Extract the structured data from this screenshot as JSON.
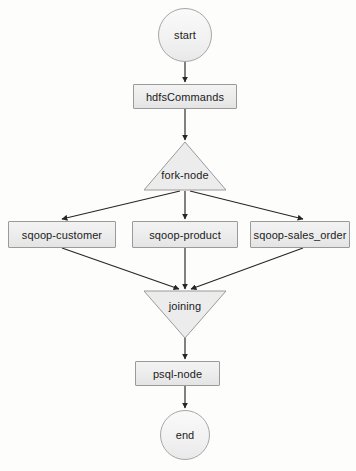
{
  "diagram": {
    "background_color": "#fdfdfc",
    "node_fill": "#ececec",
    "node_border": "#9a9a9a",
    "edge_color": "#262626",
    "text_color": "#1b1b1b"
  },
  "nodes": {
    "start": {
      "label": "start",
      "shape": "circle"
    },
    "hdfs": {
      "label": "hdfsCommands",
      "shape": "rectangle"
    },
    "fork": {
      "label": "fork-node",
      "shape": "triangle-up"
    },
    "sqoop_customer": {
      "label": "sqoop-customer",
      "shape": "rectangle"
    },
    "sqoop_product": {
      "label": "sqoop-product",
      "shape": "rectangle"
    },
    "sqoop_sales_order": {
      "label": "sqoop-sales_order",
      "shape": "rectangle"
    },
    "joining": {
      "label": "joining",
      "shape": "triangle-down"
    },
    "psql": {
      "label": "psql-node",
      "shape": "rectangle"
    },
    "end": {
      "label": "end",
      "shape": "circle"
    }
  },
  "edges": [
    {
      "name": "start-to-hdfs",
      "from": "start",
      "to": "hdfs"
    },
    {
      "name": "hdfs-to-fork",
      "from": "hdfs",
      "to": "fork"
    },
    {
      "name": "fork-to-sqoop-customer",
      "from": "fork",
      "to": "sqoop_customer"
    },
    {
      "name": "fork-to-sqoop-product",
      "from": "fork",
      "to": "sqoop_product"
    },
    {
      "name": "fork-to-sqoop-sales-order",
      "from": "fork",
      "to": "sqoop_sales_order"
    },
    {
      "name": "sqoop-customer-to-joining",
      "from": "sqoop_customer",
      "to": "joining"
    },
    {
      "name": "sqoop-product-to-joining",
      "from": "sqoop_product",
      "to": "joining"
    },
    {
      "name": "sqoop-sales-order-to-joining",
      "from": "sqoop_sales_order",
      "to": "joining"
    },
    {
      "name": "joining-to-psql",
      "from": "joining",
      "to": "psql"
    },
    {
      "name": "psql-to-end",
      "from": "psql",
      "to": "end"
    }
  ]
}
